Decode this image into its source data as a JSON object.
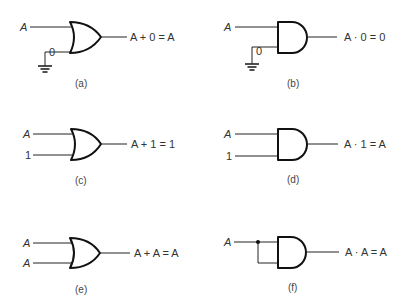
{
  "panels": [
    {
      "id": "a",
      "gate": "OR",
      "inputs": [
        "A",
        "0"
      ],
      "input1_source": "ground",
      "expression": "A + 0 = A",
      "caption": "(a)"
    },
    {
      "id": "b",
      "gate": "AND",
      "inputs": [
        "A",
        "0"
      ],
      "input1_source": "ground",
      "expression": "A · 0 = 0",
      "caption": "(b)"
    },
    {
      "id": "c",
      "gate": "OR",
      "inputs": [
        "A",
        "1"
      ],
      "expression": "A + 1 = 1",
      "caption": "(c)"
    },
    {
      "id": "d",
      "gate": "AND",
      "inputs": [
        "A",
        "1"
      ],
      "expression": "A · 1 = A",
      "caption": "(d)"
    },
    {
      "id": "e",
      "gate": "OR",
      "inputs": [
        "A",
        "A"
      ],
      "expression": "A + A = A",
      "caption": "(e)"
    },
    {
      "id": "f",
      "gate": "AND",
      "inputs": [
        "A"
      ],
      "input_tied": true,
      "expression": "A · A = A",
      "caption": "(f)"
    }
  ]
}
